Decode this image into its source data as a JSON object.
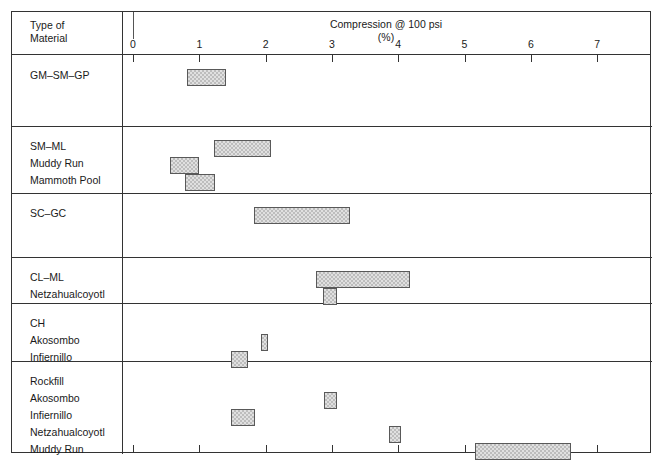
{
  "figure": {
    "row_header_label": "Type of\nMaterial",
    "title": "Compression @ 100 psi",
    "subtitle": "(%)"
  },
  "chart_data": {
    "type": "bar",
    "orientation": "horizontal",
    "title": "Compression @ 100 psi",
    "subtitle": "(%)",
    "xlabel": "Compression @ 100 psi (%)",
    "ylabel": "Type of Material",
    "xlim": [
      0,
      7.9
    ],
    "xticks": [
      0,
      1,
      2,
      3,
      4,
      5,
      6,
      7
    ],
    "xticklabels": [
      "0",
      "1",
      "2",
      "3",
      "4",
      "5",
      "6",
      "7"
    ],
    "grid": false,
    "legend": "none",
    "groups": [
      {
        "name": "GM-SM-GP",
        "labels": [
          "GM–SM–GP"
        ],
        "bars": [
          {
            "label": "GM–SM–GP",
            "low": 0.81,
            "high": 1.4
          }
        ]
      },
      {
        "name": "SM-ML",
        "labels": [
          "SM–ML",
          "Muddy Run",
          "Mammoth Pool"
        ],
        "bars": [
          {
            "label": "SM–ML",
            "low": 1.22,
            "high": 2.08
          },
          {
            "label": "Muddy Run",
            "low": 0.56,
            "high": 1.0
          },
          {
            "label": "Mammoth Pool",
            "low": 0.78,
            "high": 1.24
          }
        ]
      },
      {
        "name": "SC-GC",
        "labels": [
          "SC–GC"
        ],
        "bars": [
          {
            "label": "SC–GC",
            "low": 1.82,
            "high": 3.27
          }
        ]
      },
      {
        "name": "CL-ML",
        "labels": [
          "CL–ML",
          "Netzahualcoyotl"
        ],
        "bars": [
          {
            "label": "CL–ML",
            "low": 2.76,
            "high": 4.18
          },
          {
            "label": "Netzahualcoyotl",
            "low": 2.87,
            "high": 3.08
          }
        ]
      },
      {
        "name": "CH",
        "labels": [
          "CH",
          "Akosombo",
          "Infiernillo"
        ],
        "bars": [
          {
            "label": "Akosombo",
            "low": 1.93,
            "high": 2.04
          },
          {
            "label": "Infiernillo",
            "low": 1.48,
            "high": 1.73
          }
        ]
      },
      {
        "name": "Rockfill",
        "labels": [
          "Rockfill",
          "Akosombo",
          "Infiernillo",
          "Netzahualcoyotl",
          "Muddy Run"
        ],
        "bars": [
          {
            "label": "Akosombo",
            "low": 2.88,
            "high": 3.08
          },
          {
            "label": "Infiernillo",
            "low": 1.48,
            "high": 1.84
          },
          {
            "label": "Netzahualcoyotl",
            "low": 3.86,
            "high": 4.04
          },
          {
            "label": "Muddy Run",
            "low": 5.16,
            "high": 6.61
          }
        ]
      }
    ]
  },
  "colors": {
    "frame": "#333333",
    "bar_border": "#595959",
    "bar_fill": "#e0e0e0",
    "text": "#1a1a1a",
    "background": "#ffffff"
  }
}
